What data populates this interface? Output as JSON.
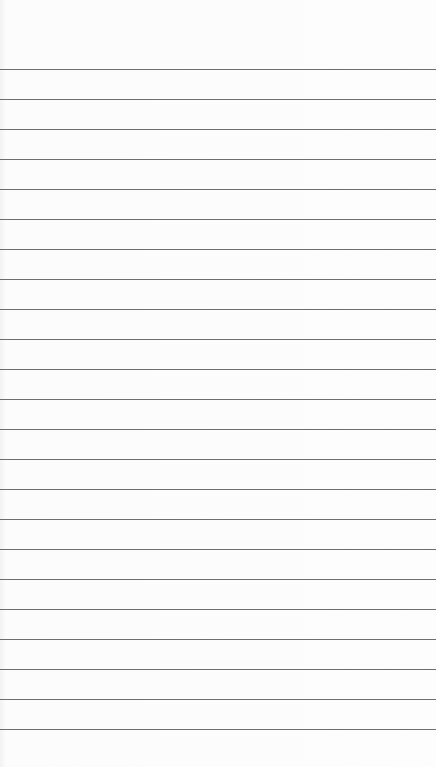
{
  "paper": {
    "background": "#fbfbfb",
    "line_color": "#555555",
    "first_line_y": 69,
    "line_spacing": 30,
    "line_count": 23
  }
}
